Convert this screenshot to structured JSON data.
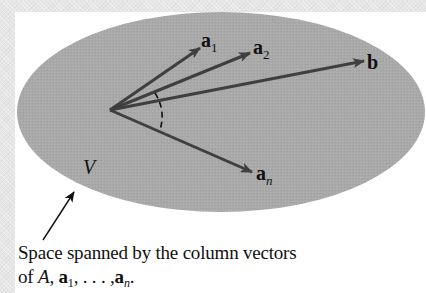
{
  "figure": {
    "region_label": "V",
    "vectors": [
      {
        "id": "a1",
        "base": "a",
        "sub": "1",
        "from": [
          110,
          110
        ],
        "to": [
          200,
          48
        ],
        "label_pos": [
          204,
          30
        ]
      },
      {
        "id": "a2",
        "base": "a",
        "sub": "2",
        "from": [
          110,
          110
        ],
        "to": [
          250,
          53
        ],
        "label_pos": [
          254,
          36
        ]
      },
      {
        "id": "b",
        "base": "b",
        "sub": "",
        "from": [
          110,
          110
        ],
        "to": [
          364,
          61
        ],
        "label_pos": [
          367,
          51
        ]
      },
      {
        "id": "an",
        "base": "a",
        "sub": "n",
        "from": [
          110,
          110
        ],
        "to": [
          252,
          172
        ],
        "label_pos": [
          256,
          163
        ]
      }
    ],
    "colors": {
      "region_fill": "#a9a9a9",
      "vector_stroke": "#3f3f3f",
      "background_border": "#e6e6e6",
      "panel": "#ffffff",
      "text": "#111111"
    }
  },
  "caption": {
    "line1": "Space spanned by the column vectors",
    "line2_prefix": "of ",
    "matrix": "A",
    "sep1": ", ",
    "a1_base": "a",
    "a1_sub": "1",
    "ellipsis": ", . . . ,",
    "an_base": "a",
    "an_sub": "n",
    "end": "."
  }
}
